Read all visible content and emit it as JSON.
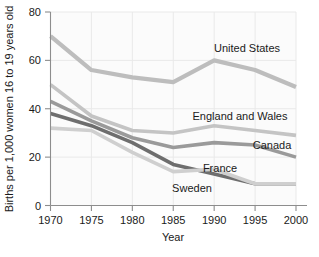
{
  "chart_data": {
    "type": "line",
    "title": "",
    "xlabel": "Year",
    "ylabel": "Births per 1,000 women 16 to 19 years old",
    "x": [
      1970,
      1975,
      1980,
      1985,
      1990,
      1995,
      2000
    ],
    "xtick_labels": [
      "1970",
      "1975",
      "1980",
      "1985",
      "1990",
      "1995",
      "2000"
    ],
    "ytick_labels": [
      "0",
      "20",
      "40",
      "60",
      "80"
    ],
    "yticks": [
      0,
      20,
      40,
      60,
      80
    ],
    "ylim": [
      0,
      80
    ],
    "xlim": [
      1970,
      2000
    ],
    "grid": true,
    "legend_position": "inline-annotations",
    "series": [
      {
        "name": "United States",
        "label": "United States",
        "color": "#bdbdbd",
        "width": 4.2,
        "values": [
          70,
          56,
          53,
          51,
          60,
          56,
          49
        ]
      },
      {
        "name": "England and Wales",
        "label": "England and Wales",
        "color": "#c4c4c4",
        "width": 3.6,
        "values": [
          50,
          37,
          31,
          30,
          33,
          31,
          29
        ]
      },
      {
        "name": "Canada",
        "label": "Canada",
        "color": "#9a9a9a",
        "width": 3.6,
        "values": [
          43,
          35,
          28,
          24,
          26,
          25,
          20
        ]
      },
      {
        "name": "France",
        "label": "France",
        "color": "#6e6e6e",
        "width": 3.6,
        "values": [
          38,
          33,
          26,
          17,
          13,
          9,
          9
        ]
      },
      {
        "name": "Sweden",
        "label": "Sweden",
        "color": "#cfcfcf",
        "width": 3.6,
        "values": [
          32,
          31,
          22,
          14,
          15,
          9,
          9
        ]
      }
    ],
    "annotations": [
      {
        "text": "United States",
        "x": 247,
        "y": 52
      },
      {
        "text": "England and Wales",
        "x": 240,
        "y": 120
      },
      {
        "text": "Canada",
        "x": 272,
        "y": 149
      },
      {
        "text": "France",
        "x": 220,
        "y": 172
      },
      {
        "text": "Sweden",
        "x": 192,
        "y": 192
      }
    ]
  }
}
